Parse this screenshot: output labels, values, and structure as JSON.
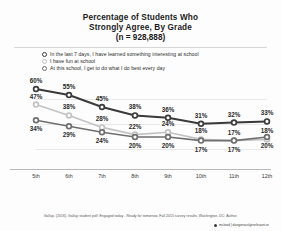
{
  "chart_data": {
    "type": "line",
    "title": "Percentage of Students Who Strongly Agree, By Grade",
    "title_lines": [
      "Percentage of Students Who",
      "Strongly Agree, By Grade"
    ],
    "subtitle": "(n = 928,888)",
    "xlabel": "",
    "ylabel": "",
    "grid": true,
    "legend_position": "top",
    "categories": [
      "5th",
      "6th",
      "7th",
      "8th",
      "9th",
      "10th",
      "11th",
      "12th"
    ],
    "ylim": [
      0,
      65
    ],
    "series": [
      {
        "name": "In the last 7 days, I have learned something interesting at school",
        "marker": "circle-dark",
        "color": "#3a3a3a",
        "values": [
          60,
          55,
          45,
          38,
          36,
          31,
          32,
          33
        ],
        "labels": [
          "60%",
          "55%",
          "45%",
          "38%",
          "36%",
          "31%",
          "32%",
          "33%"
        ]
      },
      {
        "name": "I have fun at school",
        "marker": "circle-light",
        "color": "#c2c2c2",
        "values": [
          47,
          38,
          28,
          22,
          24,
          18,
          17,
          18
        ],
        "labels": [
          "47%",
          "38%",
          "28%",
          "22%",
          "24%",
          "18%",
          "17%",
          "18%"
        ]
      },
      {
        "name": "At this school, I get to do what I do best every day",
        "marker": "circle-mid",
        "color": "#6f6f6f",
        "values": [
          34,
          29,
          24,
          20,
          20,
          17,
          17,
          20
        ],
        "labels": [
          "34%",
          "29%",
          "24%",
          "20%",
          "20%",
          "17%",
          "17%",
          "20%"
        ]
      }
    ]
  },
  "legend": {
    "items": [
      {
        "label": "In the last 7 days, I have learned something interesting at school",
        "marker": "circle-dark-icon"
      },
      {
        "label": "I have fun at school",
        "marker": "circle-light-icon"
      },
      {
        "label": "At this school, I get to do what I do best every day",
        "marker": "circle-mid-icon"
      }
    ]
  },
  "footer": {
    "source": "Gallup. (2016). Gallup student poll: Engaged today - Ready for tomorrow. Fall 2015 survey results. Washington, DC: Author.",
    "handle": "mcleod | dangerouslyirrelevant.or"
  }
}
